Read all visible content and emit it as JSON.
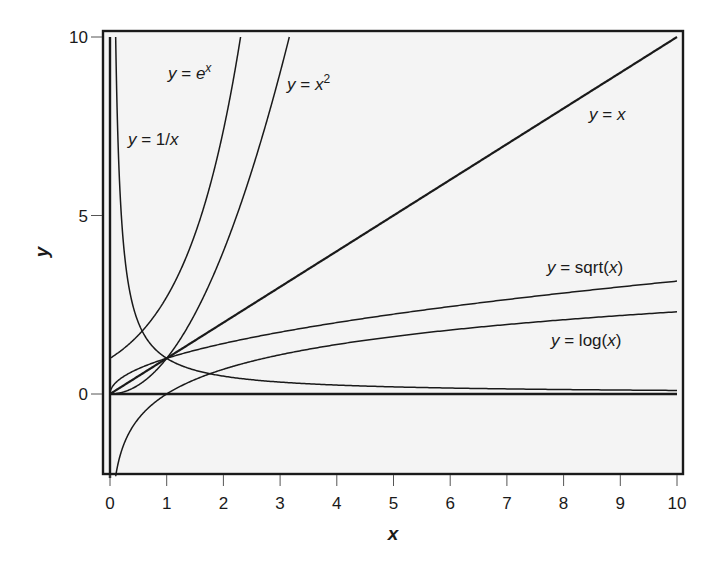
{
  "chart_data": {
    "type": "line",
    "title": "",
    "xlabel": "x",
    "ylabel": "y",
    "xlim": [
      0,
      10
    ],
    "ylim": [
      -2.3,
      10.2
    ],
    "grid": false,
    "legend": "none (inline curve labels)",
    "x_ticks": [
      0,
      1,
      2,
      3,
      4,
      5,
      6,
      7,
      8,
      9,
      10
    ],
    "y_ticks": [
      0,
      5,
      10
    ],
    "series": [
      {
        "name": "y = x",
        "function": "x",
        "label_position": {
          "x": 9.0,
          "y": 7.9
        },
        "x": [
          0,
          10
        ],
        "values": [
          0,
          10
        ]
      },
      {
        "name": "y = e^x",
        "function": "exp",
        "label_position": {
          "x": 1.1,
          "y": 9.2
        },
        "x": [
          0,
          0.5,
          1,
          1.5,
          2,
          2.303
        ],
        "values": [
          1,
          1.65,
          2.72,
          4.48,
          7.39,
          10
        ]
      },
      {
        "name": "y = x^2",
        "function": "square",
        "label_position": {
          "x": 3.1,
          "y": 9.0
        },
        "x": [
          0,
          1,
          2,
          2.5,
          3,
          3.162
        ],
        "values": [
          0,
          1,
          4,
          6.25,
          9,
          10
        ]
      },
      {
        "name": "y = 1/x",
        "function": "reciprocal",
        "label_position": {
          "x": 0.35,
          "y": 7.0
        },
        "x": [
          0.1,
          0.2,
          0.5,
          1,
          2,
          5,
          10
        ],
        "values": [
          10,
          5,
          2,
          1,
          0.5,
          0.2,
          0.1
        ]
      },
      {
        "name": "y = sqrt(x)",
        "function": "sqrt",
        "label_position": {
          "x": 7.7,
          "y": 3.4
        },
        "x": [
          0,
          1,
          4,
          9,
          10
        ],
        "values": [
          0,
          1,
          2,
          3,
          3.16
        ]
      },
      {
        "name": "y = log(x)",
        "function": "ln",
        "label_position": {
          "x": 7.7,
          "y": 1.4
        },
        "x": [
          0.1,
          0.5,
          1,
          2,
          5,
          10
        ],
        "values": [
          -2.3,
          -0.69,
          0,
          0.69,
          1.61,
          2.3
        ]
      },
      {
        "name": "y = 0",
        "function": "zero",
        "x": [
          0,
          10
        ],
        "values": [
          0,
          0
        ]
      },
      {
        "name": "x = 0",
        "function": "vertical",
        "x": [
          0,
          0
        ],
        "values": [
          -2.3,
          10
        ]
      }
    ],
    "labels": {
      "y_eq_x": {
        "pre": "y",
        "mid": " = ",
        "post": "x"
      },
      "y_eq_ex": {
        "pre": "y",
        "mid": " = ",
        "base": "e",
        "sup": "x"
      },
      "y_eq_x2": {
        "pre": "y",
        "mid": " = ",
        "base": "x",
        "sup": "2"
      },
      "y_eq_inv": {
        "pre": "y",
        "mid": " = 1/",
        "post": "x"
      },
      "y_eq_sqrt": {
        "pre": "y",
        "mid": " = sqrt(",
        "var": "x",
        "close": ")"
      },
      "y_eq_log": {
        "pre": "y",
        "mid": " = log(",
        "var": "x",
        "close": ")"
      }
    },
    "colors": {
      "plot_background": "#f4f4f4",
      "line": "#1a1a1a",
      "frame": "#1a1a1a",
      "page_background": "#ffffff"
    }
  }
}
